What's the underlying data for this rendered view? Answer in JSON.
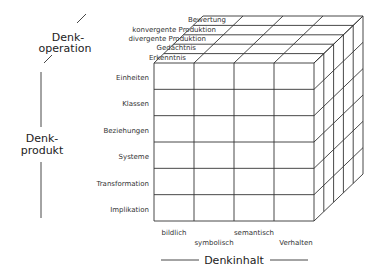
{
  "diagram": {
    "axes": {
      "operation": {
        "title_line1": "Denk-",
        "title_line2": "operation",
        "items": [
          "Bewertung",
          "konvergente Produktion",
          "divergente Produktion",
          "Gedächtnis",
          "Erkenntnis"
        ]
      },
      "product": {
        "title_line1": "Denk-",
        "title_line2": "produkt",
        "items": [
          "Einheiten",
          "Klassen",
          "Beziehungen",
          "Systeme",
          "Transformation",
          "Implikation"
        ]
      },
      "content": {
        "title": "Denkinhalt",
        "items": [
          "bildlich",
          "symbolisch",
          "semantisch",
          "Verhalten"
        ]
      }
    },
    "colors": {
      "line": "#333333",
      "background": "#ffffff"
    }
  }
}
